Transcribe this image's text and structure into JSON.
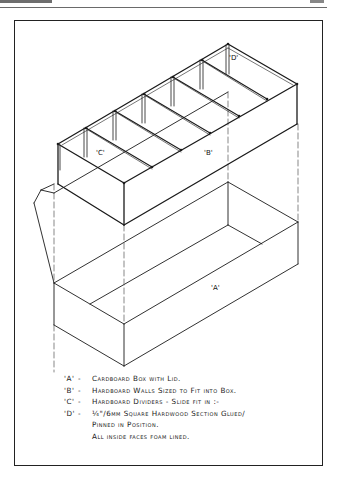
{
  "page": {
    "header_left": "",
    "header_right": ""
  },
  "figure": {
    "labels": {
      "a": "'A'",
      "b": "'B'",
      "c": "'C'",
      "d": "'D'"
    },
    "colors": {
      "ink": "#1a1a1a",
      "paper": "#ffffff",
      "frame": "#222222"
    }
  },
  "legend": {
    "items": [
      {
        "key": "'A'",
        "dash": "-",
        "text": "Cardboard Box with Lid."
      },
      {
        "key": "'B'",
        "dash": "-",
        "text": "Hardboard Walls Sized to Fit into Box."
      },
      {
        "key": "'C'",
        "dash": "-",
        "text": "Hardboard Dividers - Slide fit in :-"
      },
      {
        "key": "'D'",
        "dash": "-",
        "text": "¼\"/6mm Square Hardwood Section Glued/"
      }
    ],
    "continuation": [
      "Pinned in Position.",
      "All inside faces foam lined."
    ]
  }
}
